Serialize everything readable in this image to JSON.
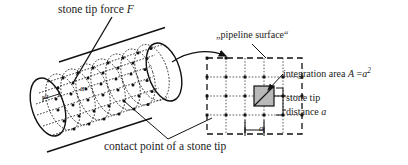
{
  "figure": {
    "domain": "technical-diagram",
    "colors": {
      "ink": "#1a1a1a",
      "line": "#111111",
      "tip_fill": "#b9b9b9",
      "paper": "#ffffff"
    }
  },
  "labels": {
    "force": {
      "text_plain": "stone tip force",
      "symbol": "F"
    },
    "pipeline_surface": {
      "text": "„pipeline surface“"
    },
    "integration_area": {
      "prefix": "integration area",
      "symbol": "A",
      "equals": "=",
      "value_base": "a",
      "value_exp": "2"
    },
    "stone_tip": {
      "text": "stone tip"
    },
    "distance": {
      "prefix": "distance",
      "symbol": "a"
    },
    "caption": {
      "text": "contact point of a stone tip"
    },
    "cylinder_a_1": {
      "symbol": "a"
    },
    "cylinder_a_2": {
      "symbol": "a"
    },
    "dimension_a": {
      "symbol": "a"
    }
  },
  "geometry": {
    "cylinder": {
      "grid_rings": 8,
      "grid_lines_along": 6,
      "axis_tilt_deg": -18
    },
    "detail_grid": {
      "columns": 5,
      "rows": 4,
      "cell_px": 19,
      "border_style": "dashed",
      "inner_style": "dotted",
      "node_marker": "square-dot"
    },
    "highlighted_cell": {
      "name": "stone-tip-cell",
      "has_diagonal": true,
      "fill": "#b9b9b9"
    }
  }
}
